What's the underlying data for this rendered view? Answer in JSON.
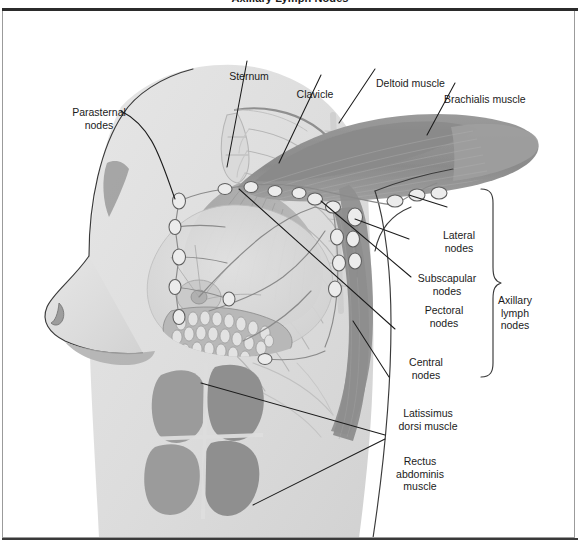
{
  "title": "Axillary Lymph Nodes",
  "figure": {
    "alt": "Lateral view of female chest and arm showing breast, pectoral and deltoid musculature, rib cage and the axillary lymph node chains",
    "colors": {
      "background": "#ffffff",
      "body_tint": "#dcdcdc",
      "muscle_dark": "#8d8d8d",
      "muscle_mid": "#a9a9a9",
      "muscle_light": "#c2c2c2",
      "skeleton_line": "#b4b4b4",
      "node_fill": "#e9e9e9",
      "node_stroke": "#6a6a6a",
      "vessel": "#7d7d7d",
      "leader_line": "#1b1b1b",
      "frame_border": "#9b9b9b",
      "rule": "#2b2b2b",
      "text": "#1b1b1b"
    }
  },
  "labels": [
    {
      "id": "parasternal-nodes",
      "lines": [
        "Parasternal",
        "nodes"
      ],
      "x": 96,
      "y": 70,
      "align": "center"
    },
    {
      "id": "sternum",
      "lines": [
        "Sternum"
      ],
      "x": 246,
      "y": 34,
      "align": "center"
    },
    {
      "id": "clavicle",
      "lines": [
        "Clavicle"
      ],
      "x": 312,
      "y": 52,
      "align": "center"
    },
    {
      "id": "deltoid-muscle",
      "lines": [
        "Deltoid muscle"
      ],
      "x": 375,
      "y": 41,
      "align": "left"
    },
    {
      "id": "brachialis-muscle",
      "lines": [
        "Brachialis muscle"
      ],
      "x": 443,
      "y": 57,
      "align": "left"
    },
    {
      "id": "lateral-nodes",
      "lines": [
        "Lateral",
        "nodes"
      ],
      "x": 455,
      "y": 193,
      "align": "center"
    },
    {
      "id": "subscapular-nodes",
      "lines": [
        "Subscapular",
        "nodes"
      ],
      "x": 412,
      "y": 236,
      "align": "left"
    },
    {
      "id": "pectoral-nodes",
      "lines": [
        "Pectoral",
        "nodes"
      ],
      "x": 414,
      "y": 268,
      "align": "left"
    },
    {
      "id": "central-nodes",
      "lines": [
        "Central",
        "nodes"
      ],
      "x": 397,
      "y": 320,
      "align": "left"
    },
    {
      "id": "latissimus-dorsi",
      "lines": [
        "Latissimus",
        "dorsi muscle"
      ],
      "x": 390,
      "y": 371,
      "align": "left"
    },
    {
      "id": "rectus-abdominis",
      "lines": [
        "Rectus",
        "abdominis",
        "muscle"
      ],
      "x": 387,
      "y": 419,
      "align": "left"
    },
    {
      "id": "axillary-lymph-nodes",
      "lines": [
        "Axillary",
        "lymph",
        "nodes"
      ],
      "x": 512,
      "y": 271,
      "align": "center"
    }
  ],
  "brace": {
    "id": "axillary-brace",
    "x": 492,
    "y_top": 188,
    "y_bottom": 410
  }
}
